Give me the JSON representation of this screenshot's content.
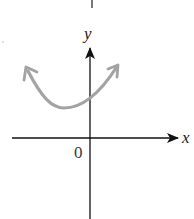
{
  "figure": {
    "type": "coordinate-graph",
    "x_axis_label": "x",
    "y_axis_label": "y",
    "origin_label": "0",
    "curve": {
      "shape": "upward-opening parabola",
      "arrows_at_ends": true,
      "color": "#9e9e9e",
      "vertex_position": "left of y-axis, above x-axis"
    },
    "axis_color": "#111111",
    "background_color": "#ffffff"
  }
}
